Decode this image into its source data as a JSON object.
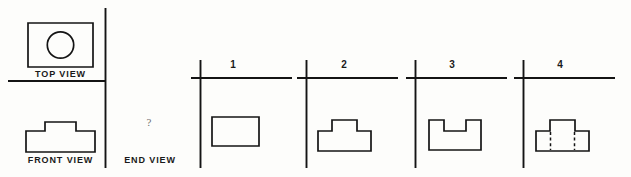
{
  "figure": {
    "type": "orthographic-projection-question",
    "background_color": "#fdfdfb",
    "line_color": "#141414",
    "question_mark": "?",
    "labels": {
      "top_view": "TOP VIEW",
      "front_view": "FRONT VIEW",
      "end_view": "END VIEW"
    },
    "given_views": {
      "top_view": {
        "description": "rectangle with centered circle",
        "outline": "M 28 23 L 93 23 L 93 67 L 28 67 Z",
        "circle": {
          "cx": 60.5,
          "cy": 45,
          "r": 13.2
        }
      },
      "front_view": {
        "description": "stepped block: wide base with centered raised boss",
        "outline": "M 26 131 L 26 152 L 95 152 L 95 131 L 76 131 L 76 122 L 45 122 L 45 131 Z"
      }
    },
    "divider_lines": {
      "horizontal": {
        "x1": 8,
        "y1": 81,
        "x2": 106,
        "y2": 81
      },
      "vertical": {
        "x1": 105.5,
        "y1": 8,
        "x2": 105.5,
        "y2": 168
      }
    },
    "options": [
      {
        "number": "1",
        "number_x": 233,
        "axis": {
          "vx": 200.5,
          "vy1": 60,
          "vy2": 168,
          "hx1": 191,
          "hx2": 292,
          "hy": 78
        },
        "shape_description": "plain rectangle",
        "shape_path": "M 212 117 L 259 117 L 259 146 L 212 146 Z",
        "hidden_lines": []
      },
      {
        "number": "2",
        "number_x": 344,
        "axis": {
          "vx": 306.5,
          "vy1": 60,
          "vy2": 168,
          "hx1": 297,
          "hx2": 398,
          "hy": 78
        },
        "shape_description": "stepped block with raised boss on top",
        "shape_path": "M 318 131 L 318 151 L 371 151 L 371 131 L 357 131 L 357 120 L 332 120 L 332 131 Z",
        "hidden_lines": []
      },
      {
        "number": "3",
        "number_x": 452,
        "axis": {
          "vx": 415.5,
          "vy1": 60,
          "vy2": 168,
          "hx1": 406,
          "hx2": 507,
          "hy": 78
        },
        "shape_description": "channel / U-shaped profile with notch cut from top",
        "shape_path": "M 429 120 L 429 150 L 481 150 L 481 120 L 466 120 L 466 131 L 444 131 L 444 120 Z",
        "hidden_lines": []
      },
      {
        "number": "4",
        "number_x": 560,
        "axis": {
          "vx": 523.5,
          "vy1": 60,
          "vy2": 168,
          "hx1": 514,
          "hx2": 615,
          "hy": 78
        },
        "shape_description": "stepped block with boss and two hidden dashed lines in base",
        "shape_path": "M 536 131 L 536 151 L 589 151 L 589 131 L 575 131 L 575 120 L 550 120 L 550 131 Z",
        "hidden_lines": [
          {
            "x": 550.5,
            "y1": 132,
            "y2": 150
          },
          {
            "x": 574.5,
            "y1": 132,
            "y2": 150
          }
        ]
      }
    ]
  }
}
